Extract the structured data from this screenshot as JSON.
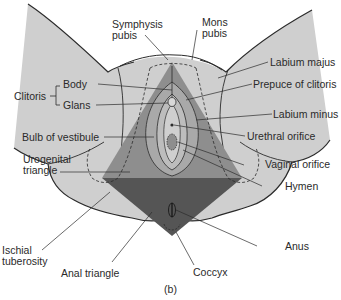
{
  "figure": {
    "panel_label": "(b)",
    "colors": {
      "skin": "#cfcfcf",
      "outline": "#2b2b2b",
      "urogenital_triangle": "#8e8e8e",
      "anal_triangle": "#555555",
      "vestibule_outer": "#a9a9a9",
      "vestibule_inner": "#bdbdbd",
      "text": "#2a2a2a",
      "background": "#ffffff"
    },
    "labels": {
      "symphysis_pubis": [
        "Symphysis",
        "pubis"
      ],
      "mons_pubis": [
        "Mons",
        "pubis"
      ],
      "clitoris": "Clitoris",
      "clitoris_body": "Body",
      "clitoris_glans": "Glans",
      "labium_majus": "Labium majus",
      "prepuce_of_clitoris": "Prepuce of clitoris",
      "labium_minus": "Labium minus",
      "urethral_orifice": "Urethral orifice",
      "bulb_of_vestibule": "Bulb of vestibule",
      "vaginal_orifice": "Vaginal orifice",
      "hymen": "Hymen",
      "urogenital_triangle": [
        "Urogenital",
        "triangle"
      ],
      "ischial_tuberosity": [
        "Ischial",
        "tuberosity"
      ],
      "anal_triangle": "Anal triangle",
      "coccyx": "Coccyx",
      "anus": "Anus"
    }
  }
}
